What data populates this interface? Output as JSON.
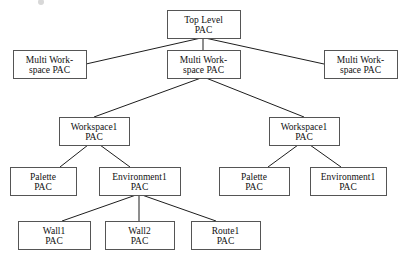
{
  "diagram": {
    "kind": "tree-diagram",
    "canvas": {
      "width": 407,
      "height": 262
    },
    "style": {
      "box_fill": "#ffffff",
      "box_border": "#555555",
      "edge_color": "#1d1d1d",
      "text_color": "#111111",
      "font_size": 9.5,
      "line_height": 10
    },
    "nodes": [
      {
        "id": "top-level-pac",
        "lines": [
          "Top Level",
          "PAC"
        ],
        "x": 167,
        "y": 10,
        "w": 73,
        "h": 28
      },
      {
        "id": "multi-workspace-pac-left",
        "lines": [
          "Multi Work-",
          "space PAC"
        ],
        "x": 13,
        "y": 50,
        "w": 73,
        "h": 28
      },
      {
        "id": "multi-workspace-pac-center",
        "lines": [
          "Multi Work-",
          "space PAC"
        ],
        "x": 167,
        "y": 50,
        "w": 73,
        "h": 28
      },
      {
        "id": "multi-workspace-pac-right",
        "lines": [
          "Multi Work-",
          "space PAC"
        ],
        "x": 324,
        "y": 50,
        "w": 73,
        "h": 28
      },
      {
        "id": "workspace1-pac-left",
        "lines": [
          "Workspace1",
          "PAC"
        ],
        "x": 59,
        "y": 117,
        "w": 70,
        "h": 28
      },
      {
        "id": "workspace1-pac-right",
        "lines": [
          "Workspace1",
          "PAC"
        ],
        "x": 269,
        "y": 117,
        "w": 70,
        "h": 28
      },
      {
        "id": "palette-pac-left",
        "lines": [
          "Palette",
          "PAC"
        ],
        "x": 10,
        "y": 167,
        "w": 66,
        "h": 28
      },
      {
        "id": "environment1-pac-left",
        "lines": [
          "Environment1",
          "PAC"
        ],
        "x": 99,
        "y": 167,
        "w": 81,
        "h": 28
      },
      {
        "id": "palette-pac-right",
        "lines": [
          "Palette",
          "PAC"
        ],
        "x": 219,
        "y": 167,
        "w": 70,
        "h": 28
      },
      {
        "id": "environment1-pac-right",
        "lines": [
          "Environment1",
          "PAC"
        ],
        "x": 310,
        "y": 167,
        "w": 76,
        "h": 28
      },
      {
        "id": "wall1-pac",
        "lines": [
          "Wall1",
          "PAC"
        ],
        "x": 18,
        "y": 221,
        "w": 72,
        "h": 28
      },
      {
        "id": "wall2-pac",
        "lines": [
          "Wall2",
          "PAC"
        ],
        "x": 105,
        "y": 221,
        "w": 69,
        "h": 28
      },
      {
        "id": "route1-pac",
        "lines": [
          "Route1",
          "PAC"
        ],
        "x": 191,
        "y": 221,
        "w": 69,
        "h": 28
      }
    ],
    "edges": [
      {
        "id": "edge-top-to-ml",
        "from": "top-level-pac",
        "to": "multi-workspace-pac-left",
        "x1": 201,
        "y1": 38,
        "x2": 86,
        "y2": 64
      },
      {
        "id": "edge-top-to-mc",
        "from": "top-level-pac",
        "to": "multi-workspace-pac-center",
        "x1": 203,
        "y1": 38,
        "x2": 203,
        "y2": 50
      },
      {
        "id": "edge-top-to-mr",
        "from": "top-level-pac",
        "to": "multi-workspace-pac-right",
        "x1": 205,
        "y1": 38,
        "x2": 324,
        "y2": 64
      },
      {
        "id": "edge-mc-to-ws-left",
        "from": "multi-workspace-pac-center",
        "to": "workspace1-pac-left",
        "x1": 201,
        "y1": 78,
        "x2": 94,
        "y2": 117
      },
      {
        "id": "edge-mc-to-ws-right",
        "from": "multi-workspace-pac-center",
        "to": "workspace1-pac-right",
        "x1": 206,
        "y1": 78,
        "x2": 304,
        "y2": 117
      },
      {
        "id": "edge-wsl-to-palette",
        "from": "workspace1-pac-left",
        "to": "palette-pac-left",
        "x1": 88,
        "y1": 145,
        "x2": 60,
        "y2": 167
      },
      {
        "id": "edge-wsl-to-env",
        "from": "workspace1-pac-left",
        "to": "environment1-pac-left",
        "x1": 100,
        "y1": 145,
        "x2": 130,
        "y2": 167
      },
      {
        "id": "edge-wsr-to-palette",
        "from": "workspace1-pac-right",
        "to": "palette-pac-right",
        "x1": 298,
        "y1": 145,
        "x2": 268,
        "y2": 167
      },
      {
        "id": "edge-wsr-to-env",
        "from": "workspace1-pac-right",
        "to": "environment1-pac-right",
        "x1": 310,
        "y1": 145,
        "x2": 341,
        "y2": 167
      },
      {
        "id": "edge-env-to-wall1",
        "from": "environment1-pac-left",
        "to": "wall1-pac",
        "x1": 136,
        "y1": 195,
        "x2": 62,
        "y2": 221
      },
      {
        "id": "edge-env-to-wall2",
        "from": "environment1-pac-left",
        "to": "wall2-pac",
        "x1": 139,
        "y1": 195,
        "x2": 139,
        "y2": 221
      },
      {
        "id": "edge-env-to-route1",
        "from": "environment1-pac-left",
        "to": "route1-pac",
        "x1": 142,
        "y1": 195,
        "x2": 216,
        "y2": 221
      }
    ]
  }
}
